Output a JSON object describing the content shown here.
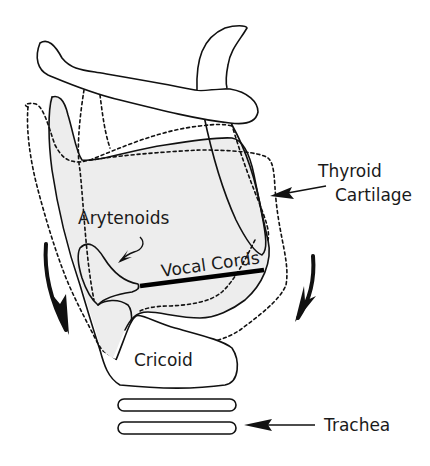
{
  "diagram": {
    "type": "anatomical-line-drawing",
    "labels": {
      "thyroid_line1": "Thyroid",
      "thyroid_line2": "Cartilage",
      "arytenoids": "Arytenoids",
      "vocal_cords": "Vocal Cords",
      "cricoid": "Cricoid",
      "trachea": "Trachea"
    },
    "colors": {
      "line": "#111111",
      "cartilage_fill": "#ededed",
      "background": "#ffffff"
    },
    "legend_notes": {
      "solid_outline": "resting position",
      "dashed_outline": "tilted position"
    }
  }
}
